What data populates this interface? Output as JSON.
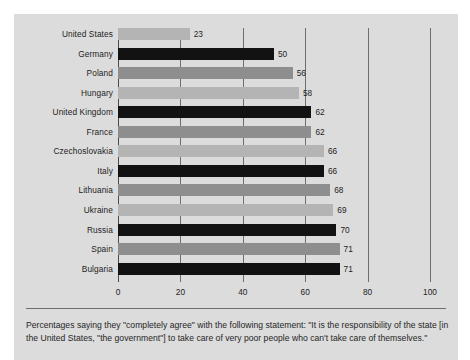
{
  "chart_data": {
    "type": "bar",
    "orientation": "horizontal",
    "title": "",
    "subtitle": "",
    "xlabel": "",
    "ylabel": "",
    "xlim": [
      0,
      100
    ],
    "xticks": [
      0,
      20,
      40,
      60,
      80,
      100
    ],
    "xtick_labels": [
      "0",
      "20",
      "40",
      "60",
      "80",
      "100"
    ],
    "grid": "vertical",
    "legend": "none",
    "categories": [
      "United States",
      "Germany",
      "Poland",
      "Hungary",
      "United Kingdom",
      "France",
      "Czechoslovakia",
      "Italy",
      "Lithuania",
      "Ukraine",
      "Russia",
      "Spain",
      "Bulgaria"
    ],
    "values": [
      23,
      50,
      56,
      58,
      62,
      62,
      66,
      66,
      68,
      69,
      70,
      71,
      71
    ],
    "value_labels": [
      "23",
      "50",
      "56",
      "58",
      "62",
      "62",
      "66",
      "66",
      "68",
      "69",
      "70",
      "71",
      "71"
    ],
    "bar_shades": [
      "light",
      "dark",
      "mid",
      "light",
      "dark",
      "mid",
      "light",
      "dark",
      "mid",
      "light",
      "dark",
      "mid",
      "dark"
    ],
    "colors": {
      "shade_light": "#b4b4b4",
      "shade_mid": "#8e8e8e",
      "shade_dark": "#121212",
      "panel_background": "#dcdcdc",
      "gridline": "#6e6e6e",
      "text": "#1d1d1d"
    }
  },
  "caption": {
    "text": "Percentages saying they \"completely agree\" with the following statement: \"It is the responsibility of the state [in the United States, \"the government\"] to take care of very poor people who can't take care of themselves.\""
  }
}
